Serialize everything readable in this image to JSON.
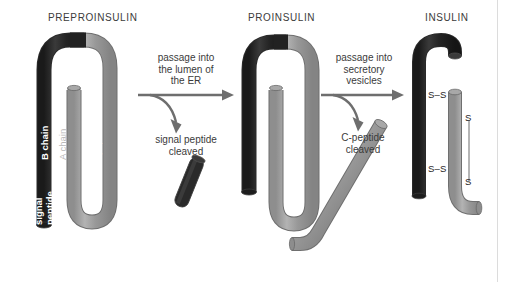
{
  "figure": {
    "background_color": "#ffffff",
    "dark_chain_color": "#2b2b2b",
    "light_chain_color": "#9a9a9a",
    "outline_color": "#3a3a3a",
    "text_color": "#3b3b3b",
    "arrow_color": "#6e6e6e"
  },
  "panels": [
    {
      "id": "preproinsulin",
      "title": "PREPROINSULIN",
      "labels": {
        "signal_peptide": "signal\npeptide",
        "b_chain": "B chain",
        "a_chain": "A chain",
        "c_peptide": "C-peptide"
      }
    },
    {
      "id": "proinsulin",
      "title": "PROINSULIN"
    },
    {
      "id": "insulin",
      "title": "INSULIN",
      "bonds": {
        "interchain_top": "S–S",
        "interchain_bottom": "S–S",
        "intrachain_top": "S",
        "intrachain_bottom": "S"
      }
    }
  ],
  "transitions": [
    {
      "id": "to-proinsulin",
      "main_text": "passage into\nthe lumen of\nthe ER",
      "branch_text": "signal peptide\ncleaved",
      "fragment": "signal-peptide-fragment"
    },
    {
      "id": "to-insulin",
      "main_text": "passage into\nsecretory\nvesicles",
      "branch_text": "C-peptide\ncleaved",
      "fragment": "c-peptide-fragment"
    }
  ]
}
